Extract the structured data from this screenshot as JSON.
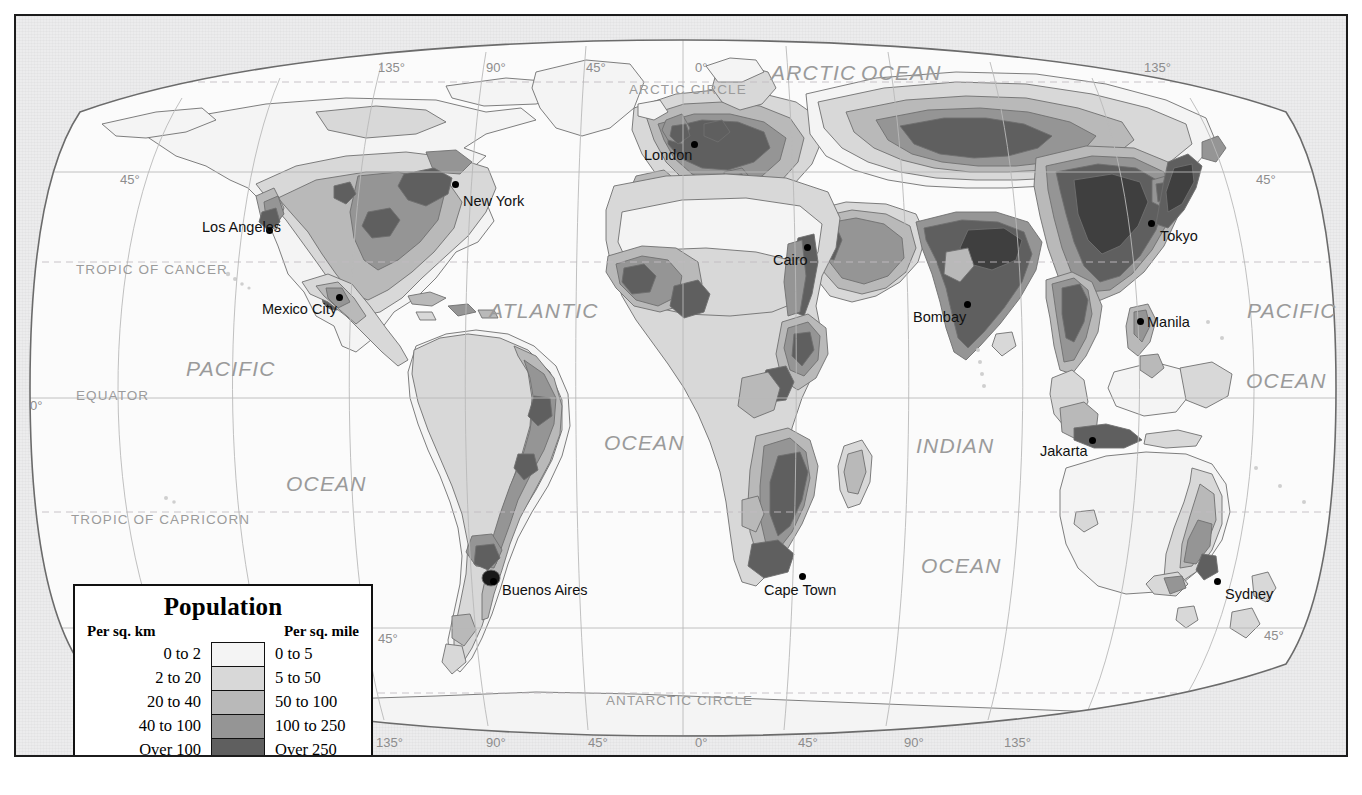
{
  "map": {
    "title": "World Population Density",
    "projection": "robinson",
    "colors": {
      "page_background": "#ffffff",
      "plate_background": "#ececed",
      "ocean": "#fbfbfb",
      "border": "#1c1c1c",
      "graticule": "#b9b9b9",
      "coastline": "#7a7a7a",
      "label_gray": "#9a9a9a"
    },
    "density_colors": [
      "#f4f4f4",
      "#d8d8d8",
      "#b9b9b9",
      "#959595",
      "#5f5f5f"
    ]
  },
  "legend": {
    "title": "Population",
    "header_left": "Per sq. km",
    "header_right": "Per sq. mile",
    "rows": [
      {
        "per_sq_km": "0 to 2",
        "per_sq_mile": "0 to 5",
        "color": "#f4f4f4"
      },
      {
        "per_sq_km": "2 to 20",
        "per_sq_mile": "5 to 50",
        "color": "#d8d8d8"
      },
      {
        "per_sq_km": "20 to 40",
        "per_sq_mile": "50 to 100",
        "color": "#b9b9b9"
      },
      {
        "per_sq_km": "40 to 100",
        "per_sq_mile": "100 to 250",
        "color": "#959595"
      },
      {
        "per_sq_km": "Over 100",
        "per_sq_mile": "Over 250",
        "color": "#5f5f5f"
      }
    ]
  },
  "cities": [
    {
      "name": "Los Angeles",
      "label_x": 186,
      "label_y": 203,
      "dot_x": 253,
      "dot_y": 214
    },
    {
      "name": "New York",
      "label_x": 447,
      "label_y": 177,
      "dot_x": 439,
      "dot_y": 168
    },
    {
      "name": "Mexico City",
      "label_x": 246,
      "label_y": 285,
      "dot_x": 323,
      "dot_y": 281
    },
    {
      "name": "Buenos Aires",
      "label_x": 486,
      "label_y": 566,
      "dot_x": 477,
      "dot_y": 565
    },
    {
      "name": "London",
      "label_x": 628,
      "label_y": 131,
      "dot_x": 678,
      "dot_y": 128
    },
    {
      "name": "Cairo",
      "label_x": 757,
      "label_y": 236,
      "dot_x": 791,
      "dot_y": 231
    },
    {
      "name": "Cape Town",
      "label_x": 748,
      "label_y": 566,
      "dot_x": 786,
      "dot_y": 560
    },
    {
      "name": "Bombay",
      "label_x": 897,
      "label_y": 293,
      "dot_x": 951,
      "dot_y": 288
    },
    {
      "name": "Manila",
      "label_x": 1131,
      "label_y": 298,
      "dot_x": 1124,
      "dot_y": 305
    },
    {
      "name": "Jakarta",
      "label_x": 1024,
      "label_y": 427,
      "dot_x": 1076,
      "dot_y": 424
    },
    {
      "name": "Tokyo",
      "label_x": 1144,
      "label_y": 212,
      "dot_x": 1135,
      "dot_y": 207
    },
    {
      "name": "Sydney",
      "label_x": 1209,
      "label_y": 570,
      "dot_x": 1201,
      "dot_y": 565
    }
  ],
  "ocean_labels": [
    {
      "text": "ARCTIC",
      "x": 755,
      "y": 45,
      "size": "lg"
    },
    {
      "text": "OCEAN",
      "x": 845,
      "y": 45,
      "size": "lg"
    },
    {
      "text": "PACIFIC",
      "x": 170,
      "y": 341,
      "size": "lg"
    },
    {
      "text": "OCEAN",
      "x": 270,
      "y": 456,
      "size": "lg"
    },
    {
      "text": "ATLANTIC",
      "x": 473,
      "y": 283,
      "size": "lg"
    },
    {
      "text": "OCEAN",
      "x": 588,
      "y": 415,
      "size": "lg"
    },
    {
      "text": "INDIAN",
      "x": 900,
      "y": 418,
      "size": "lg"
    },
    {
      "text": "OCEAN",
      "x": 905,
      "y": 538,
      "size": "lg"
    },
    {
      "text": "PACIFIC",
      "x": 1231,
      "y": 283,
      "size": "lg"
    },
    {
      "text": "OCEAN",
      "x": 1230,
      "y": 353,
      "size": "lg"
    }
  ],
  "latitude_lines": [
    {
      "text": "ARCTIC CIRCLE",
      "x": 613,
      "y": 66
    },
    {
      "text": "TROPIC OF CANCER",
      "x": 60,
      "y": 246
    },
    {
      "text": "EQUATOR",
      "x": 60,
      "y": 372
    },
    {
      "text": "TROPIC OF CAPRICORN",
      "x": 55,
      "y": 496
    },
    {
      "text": "ANTARCTIC CIRCLE",
      "x": 590,
      "y": 677
    }
  ],
  "latitude_ticks": [
    {
      "text": "45°",
      "x": 104,
      "y": 156,
      "side": "left"
    },
    {
      "text": "0°",
      "x": 14,
      "y": 382,
      "side": "left"
    },
    {
      "text": "45°",
      "x": 362,
      "y": 615,
      "side": "left"
    },
    {
      "text": "45°",
      "x": 1240,
      "y": 156,
      "side": "right"
    },
    {
      "text": "0°",
      "x": 1332,
      "y": 382,
      "side": "right"
    },
    {
      "text": "45°",
      "x": 1248,
      "y": 612,
      "side": "right"
    }
  ],
  "longitude_ticks_top": [
    {
      "text": "135°",
      "x": 362,
      "y": 44
    },
    {
      "text": "90°",
      "x": 470,
      "y": 44
    },
    {
      "text": "45°",
      "x": 570,
      "y": 44
    },
    {
      "text": "0°",
      "x": 679,
      "y": 44
    },
    {
      "text": "135°",
      "x": 1128,
      "y": 44
    }
  ],
  "longitude_ticks_bottom": [
    {
      "text": "135°",
      "x": 360,
      "y": 719
    },
    {
      "text": "90°",
      "x": 470,
      "y": 719
    },
    {
      "text": "45°",
      "x": 572,
      "y": 719
    },
    {
      "text": "0°",
      "x": 679,
      "y": 719
    },
    {
      "text": "45°",
      "x": 782,
      "y": 719
    },
    {
      "text": "90°",
      "x": 888,
      "y": 719
    },
    {
      "text": "135°",
      "x": 988,
      "y": 719
    }
  ]
}
